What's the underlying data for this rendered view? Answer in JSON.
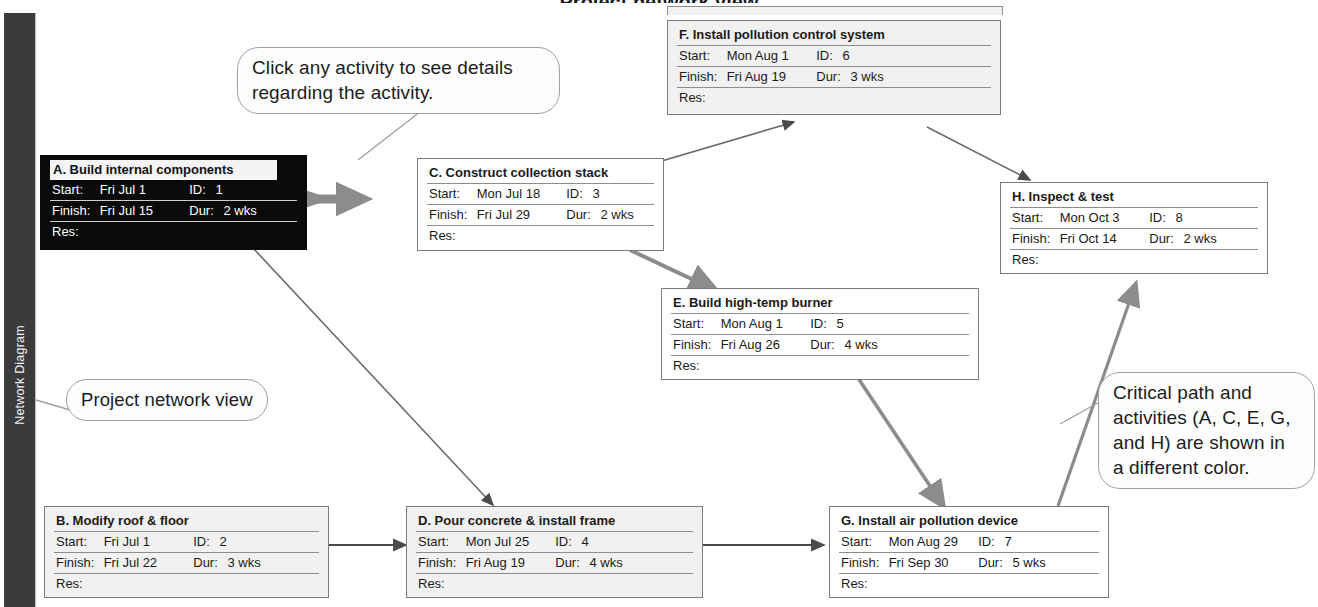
{
  "window": {
    "top_title": "Project network view",
    "sidebar_label": "Network Diagram"
  },
  "legend_colors": {
    "critical_node_bg": "#0a0a0a",
    "critical_node_text": "#ffffff",
    "critical_edge": "#8c8c8c",
    "normal_node_bg": "#f1f1f1",
    "normal_edge": "#5a5a5a",
    "border": "#7c7c7c",
    "sidebar_bg": "#3b3b3b"
  },
  "field_labels": {
    "start": "Start:",
    "finish": "Finish:",
    "id": "ID:",
    "dur": "Dur:",
    "res": "Res:"
  },
  "nodes": [
    {
      "key": "A",
      "title": "A. Build internal components",
      "start": "Fri Jul 1",
      "id": "1",
      "finish": "Fri Jul 15",
      "dur": "2 wks",
      "res": "",
      "critical": true
    },
    {
      "key": "B",
      "title": "B. Modify roof & floor",
      "start": "Fri Jul 1",
      "id": "2",
      "finish": "Fri Jul 22",
      "dur": "3 wks",
      "res": "",
      "critical": false
    },
    {
      "key": "C",
      "title": "C. Construct collection stack",
      "start": "Mon Jul 18",
      "id": "3",
      "finish": "Fri Jul 29",
      "dur": "2 wks",
      "res": "",
      "critical": false
    },
    {
      "key": "D",
      "title": "D. Pour concrete & install frame",
      "start": "Mon Jul 25",
      "id": "4",
      "finish": "Fri Aug 19",
      "dur": "4 wks",
      "res": "",
      "critical": false
    },
    {
      "key": "E",
      "title": "E. Build high-temp burner",
      "start": "Mon Aug 1",
      "id": "5",
      "finish": "Fri Aug 26",
      "dur": "4 wks",
      "res": "",
      "critical": false
    },
    {
      "key": "F",
      "title": "F. Install pollution control system",
      "start": "Mon Aug 1",
      "id": "6",
      "finish": "Fri Aug 19",
      "dur": "3 wks",
      "res": "",
      "critical": false
    },
    {
      "key": "G",
      "title": "G. Install air pollution device",
      "start": "Mon Aug 29",
      "id": "7",
      "finish": "Fri Sep 30",
      "dur": "5 wks",
      "res": "",
      "critical": false
    },
    {
      "key": "H",
      "title": "H. Inspect & test",
      "start": "Mon Oct 3",
      "id": "8",
      "finish": "Fri Oct 14",
      "dur": "2 wks",
      "res": "",
      "critical": false
    }
  ],
  "callouts": {
    "click_activity": "Click any activity to see details regarding the activity.",
    "project_network_view": "Project network view",
    "critical_path": "Critical path and activities (A, C, E, G, and H) are shown in a different color."
  },
  "edges": [
    {
      "from": "A",
      "to": "C",
      "critical": true
    },
    {
      "from": "A",
      "to": "D",
      "critical": false
    },
    {
      "from": "B",
      "to": "D",
      "critical": false
    },
    {
      "from": "C",
      "to": "F",
      "critical": false
    },
    {
      "from": "C",
      "to": "E",
      "critical": true
    },
    {
      "from": "D",
      "to": "G",
      "critical": false
    },
    {
      "from": "E",
      "to": "G",
      "critical": true
    },
    {
      "from": "F",
      "to": "H",
      "critical": false
    },
    {
      "from": "G",
      "to": "H",
      "critical": true
    }
  ]
}
